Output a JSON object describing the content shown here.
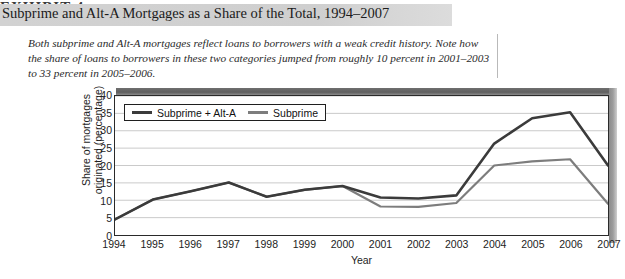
{
  "header": {
    "clipped_line": "EXHIBIT 4",
    "title": "Subprime and Alt-A Mortgages as a Share of the Total, 1994–2007"
  },
  "caption": "Both subprime and Alt-A mortgages reflect loans to borrowers with a weak credit history. Note how the share of loans to borrowers in these two categories jumped from roughly 10 percent in 2001–2003 to 33 percent in 2005–2006.",
  "colors": {
    "series_total": "#3b3b3b",
    "series_subprime": "#7d7d7d",
    "grid": "#c9c9c9",
    "axis": "#2a2a2a",
    "wall_top": "#5f5f5f",
    "wall_right": "#9d9d9d",
    "title_band": "#d2d2d2"
  },
  "chart_data": {
    "type": "line",
    "title": "Subprime and Alt-A Mortgages as a Share of the Total, 1994–2007",
    "xlabel": "Year",
    "ylabel": "Share of mortgages originated (percentage)",
    "ylabel_line1": "Share of mortgages",
    "ylabel_line2": "originated (percentage)",
    "categories": [
      "1994",
      "1995",
      "1996",
      "1997",
      "1998",
      "1999",
      "2000",
      "2001",
      "2002",
      "2003",
      "2004",
      "2005",
      "2006",
      "2007"
    ],
    "x": [
      1994,
      1995,
      1996,
      1997,
      1998,
      1999,
      2000,
      2001,
      2002,
      2003,
      2004,
      2005,
      2006,
      2007
    ],
    "ylim": [
      0,
      40
    ],
    "yticks": [
      0,
      5,
      10,
      15,
      20,
      25,
      30,
      35,
      40
    ],
    "grid": true,
    "legend_position": "top-left",
    "series": [
      {
        "name": "Subprime + Alt-A",
        "color": "#3b3b3b",
        "values": [
          4.5,
          10.2,
          12.6,
          15.1,
          11.0,
          13.0,
          14.1,
          10.8,
          10.5,
          11.4,
          26.3,
          33.6,
          35.3,
          20.0
        ]
      },
      {
        "name": "Subprime",
        "color": "#7d7d7d",
        "values": [
          4.5,
          10.2,
          12.6,
          15.1,
          11.0,
          13.0,
          14.1,
          8.2,
          8.1,
          9.2,
          20.0,
          21.2,
          21.8,
          9.0
        ]
      }
    ]
  }
}
